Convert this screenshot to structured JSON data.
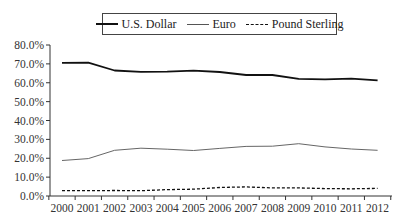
{
  "chart_data": {
    "type": "line",
    "title": "",
    "xlabel": "",
    "ylabel": "",
    "x": [
      "2000",
      "2001",
      "2002",
      "2003",
      "2004",
      "2005",
      "2006",
      "2007",
      "2008",
      "2009",
      "2010",
      "2011",
      "2012"
    ],
    "ylim": [
      0,
      80
    ],
    "yticks": [
      "0.0%",
      "10.0%",
      "20.0%",
      "30.0%",
      "40.0%",
      "50.0%",
      "60.0%",
      "70.0%",
      "80.0%"
    ],
    "grid": false,
    "legend_position": "top",
    "series": [
      {
        "name": "U.S. Dollar",
        "style": "solid-thick",
        "values": [
          70.5,
          70.7,
          66.5,
          65.8,
          65.9,
          66.4,
          65.7,
          64.1,
          64.1,
          62.1,
          61.8,
          62.2,
          61.3
        ]
      },
      {
        "name": "Euro",
        "style": "solid-thin",
        "values": [
          18.8,
          19.8,
          24.2,
          25.3,
          24.8,
          24.1,
          25.2,
          26.3,
          26.4,
          27.7,
          26.0,
          24.9,
          24.2
        ]
      },
      {
        "name": "Pound Sterling",
        "style": "dashed",
        "values": [
          2.8,
          2.8,
          2.9,
          2.8,
          3.4,
          3.6,
          4.5,
          4.8,
          4.3,
          4.3,
          3.9,
          3.8,
          4.0
        ]
      }
    ]
  },
  "legend": {
    "items": [
      {
        "label": "U.S. Dollar"
      },
      {
        "label": "Euro"
      },
      {
        "label": "Pound Sterling"
      }
    ]
  }
}
